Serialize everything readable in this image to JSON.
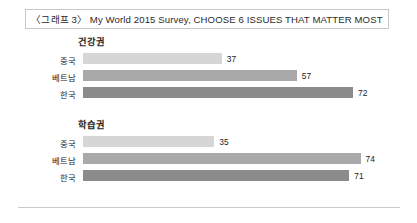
{
  "title": {
    "text": "〈그래프 3〉 My World 2015 Survey, CHOOSE 6 ISSUES THAT MATTER MOST"
  },
  "colors": {
    "bar_china": "#d6d6d6",
    "bar_vietnam": "#a9a9a9",
    "bar_korea": "#8b8b8b",
    "title_border": "#c8c8c8",
    "rule": "#c9c9c9",
    "text": "#1d1d1d"
  },
  "chart_data": [
    {
      "type": "bar",
      "orientation": "horizontal",
      "title": "건강권",
      "categories": [
        "중국",
        "베트남",
        "한국"
      ],
      "values": [
        37,
        57,
        72
      ],
      "value_labels": [
        "37",
        "57",
        "72"
      ],
      "colors": [
        "#d6d6d6",
        "#a9a9a9",
        "#8b8b8b"
      ],
      "xlabel": "",
      "ylabel": "",
      "xlim": [
        0,
        80
      ],
      "grid": false,
      "legend": false
    },
    {
      "type": "bar",
      "orientation": "horizontal",
      "title": "학습권",
      "categories": [
        "중국",
        "베트남",
        "한국"
      ],
      "values": [
        35,
        74,
        71
      ],
      "value_labels": [
        "35",
        "74",
        "71"
      ],
      "colors": [
        "#d6d6d6",
        "#a9a9a9",
        "#8b8b8b"
      ],
      "xlabel": "",
      "ylabel": "",
      "xlim": [
        0,
        80
      ],
      "grid": false,
      "legend": false
    }
  ]
}
